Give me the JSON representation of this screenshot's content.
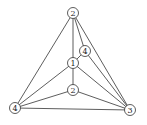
{
  "diagram": {
    "type": "graph",
    "nodes": [
      {
        "id": "n_top",
        "label": "2",
        "x": 73,
        "y": 13
      },
      {
        "id": "n_ur",
        "label": "4",
        "x": 85,
        "y": 51
      },
      {
        "id": "n_center",
        "label": "1",
        "x": 73,
        "y": 63
      },
      {
        "id": "n_low",
        "label": "2",
        "x": 73,
        "y": 90
      },
      {
        "id": "n_bl",
        "label": "4",
        "x": 15,
        "y": 108
      },
      {
        "id": "n_br",
        "label": "3",
        "x": 130,
        "y": 110
      }
    ],
    "edges": [
      [
        "n_top",
        "n_bl"
      ],
      [
        "n_top",
        "n_br"
      ],
      [
        "n_top",
        "n_center"
      ],
      [
        "n_top",
        "n_ur"
      ],
      [
        "n_ur",
        "n_center"
      ],
      [
        "n_ur",
        "n_br"
      ],
      [
        "n_center",
        "n_bl"
      ],
      [
        "n_center",
        "n_br"
      ],
      [
        "n_center",
        "n_low"
      ],
      [
        "n_low",
        "n_bl"
      ],
      [
        "n_low",
        "n_br"
      ],
      [
        "n_bl",
        "n_br"
      ]
    ],
    "colors": {
      "stroke": "#333333",
      "fill": "#ffffff"
    }
  }
}
